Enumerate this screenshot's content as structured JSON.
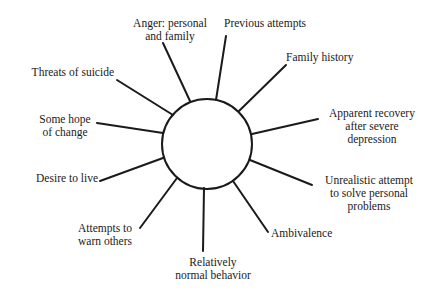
{
  "diagram": {
    "center": {
      "cx": 207,
      "cy": 144,
      "r": 45,
      "stroke": "#1a1a1a"
    },
    "spokes": [
      {
        "id": "anger",
        "label": "Anger: personal\nand family",
        "x1": 190,
        "y1": 101,
        "x2": 163,
        "y2": 43
      },
      {
        "id": "previous-attempts",
        "label": "Previous attempts",
        "x1": 216,
        "y1": 100,
        "x2": 226,
        "y2": 36
      },
      {
        "id": "family-history",
        "label": "Family history",
        "x1": 239,
        "y1": 111,
        "x2": 286,
        "y2": 65
      },
      {
        "id": "apparent-recovery",
        "label": "Apparent recovery\nafter severe\ndepression",
        "x1": 252,
        "y1": 134,
        "x2": 318,
        "y2": 119
      },
      {
        "id": "unrealistic-attempt",
        "label": "Unrealistic attempt\nto solve personal\nproblems",
        "x1": 250,
        "y1": 160,
        "x2": 312,
        "y2": 185
      },
      {
        "id": "ambivalence",
        "label": "Ambivalence",
        "x1": 233,
        "y1": 181,
        "x2": 268,
        "y2": 232
      },
      {
        "id": "relatively-normal",
        "label": "Relatively\nnormal behavior",
        "x1": 204,
        "y1": 188,
        "x2": 203,
        "y2": 251
      },
      {
        "id": "attempts-to-warn",
        "label": "Attempts to\nwarn others",
        "x1": 177,
        "y1": 178,
        "x2": 140,
        "y2": 228
      },
      {
        "id": "desire-to-live",
        "label": "Desire to live",
        "x1": 163,
        "y1": 158,
        "x2": 100,
        "y2": 181
      },
      {
        "id": "some-hope",
        "label": "Some hope\nof change",
        "x1": 163,
        "y1": 133,
        "x2": 97,
        "y2": 123
      },
      {
        "id": "threats-of-suicide",
        "label": "Threats of suicide",
        "x1": 173,
        "y1": 115,
        "x2": 117,
        "y2": 80
      }
    ]
  }
}
